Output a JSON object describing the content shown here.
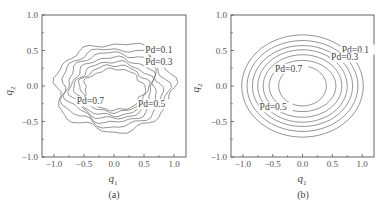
{
  "chart_data": [
    {
      "type": "contour",
      "panel_label": "(a)",
      "title": "",
      "xlabel": "q1",
      "ylabel": "q2",
      "xlim": [
        -1.2,
        1.2
      ],
      "ylim": [
        -1.0,
        1.0
      ],
      "xticks": [
        "-1.0",
        "-0.5",
        "0.0",
        "0.5",
        "1.0"
      ],
      "yticks": [
        "1.0",
        "0.5",
        "0.0",
        "-0.5",
        "-1.0"
      ],
      "grid": false,
      "style": "irregular empirical contours",
      "contour_levels": [
        0.1,
        0.2,
        0.3,
        0.4,
        0.5,
        0.6,
        0.7
      ],
      "contour_approx_extent": [
        {
          "level": 0.1,
          "rx": 0.98,
          "ry": 0.62,
          "cx": 0.0,
          "cy": -0.02
        },
        {
          "level": 0.2,
          "rx": 0.88,
          "ry": 0.55,
          "cx": 0.0,
          "cy": -0.02
        },
        {
          "level": 0.3,
          "rx": 0.79,
          "ry": 0.49,
          "cx": 0.0,
          "cy": -0.02
        },
        {
          "level": 0.4,
          "rx": 0.71,
          "ry": 0.43,
          "cx": 0.0,
          "cy": -0.03
        },
        {
          "level": 0.5,
          "rx": 0.64,
          "ry": 0.38,
          "cx": 0.0,
          "cy": -0.04
        },
        {
          "level": 0.6,
          "rx": 0.57,
          "ry": 0.33,
          "cx": 0.0,
          "cy": -0.04
        },
        {
          "level": 0.7,
          "rx": 0.5,
          "ry": 0.29,
          "cx": 0.0,
          "cy": -0.05
        }
      ],
      "annotations": [
        {
          "text": "Pd=0.1",
          "x": 0.52,
          "y": 0.47
        },
        {
          "text": "Pd=0.3",
          "x": 0.52,
          "y": 0.29
        },
        {
          "text": "Pd=0.7",
          "x": -0.62,
          "y": -0.26
        },
        {
          "text": "Pd=0.5",
          "x": 0.4,
          "y": -0.3
        }
      ]
    },
    {
      "type": "contour",
      "panel_label": "(b)",
      "title": "",
      "xlabel": "q1",
      "ylabel": "q2",
      "xlim": [
        -1.2,
        1.2
      ],
      "ylim": [
        -1.0,
        1.0
      ],
      "xticks": [
        "-1.0",
        "-0.5",
        "0.0",
        "0.5",
        "1.0"
      ],
      "yticks": [
        "1.0",
        "0.5",
        "0.0",
        "-0.5",
        "-1.0"
      ],
      "grid": false,
      "style": "smooth concentric ellipses",
      "contour_levels": [
        0.1,
        0.2,
        0.3,
        0.4,
        0.5,
        0.6,
        0.7
      ],
      "contour_approx_extent": [
        {
          "level": 0.1,
          "rx": 1.02,
          "ry": 0.72,
          "cx": 0.0,
          "cy": 0.0
        },
        {
          "level": 0.2,
          "rx": 0.93,
          "ry": 0.64,
          "cx": 0.0,
          "cy": 0.0
        },
        {
          "level": 0.3,
          "rx": 0.84,
          "ry": 0.57,
          "cx": 0.0,
          "cy": 0.0
        },
        {
          "level": 0.4,
          "rx": 0.75,
          "ry": 0.51,
          "cx": 0.0,
          "cy": 0.0
        },
        {
          "level": 0.5,
          "rx": 0.66,
          "ry": 0.44,
          "cx": 0.0,
          "cy": 0.0
        },
        {
          "level": 0.6,
          "rx": 0.56,
          "ry": 0.36,
          "cx": 0.0,
          "cy": 0.0
        },
        {
          "level": 0.7,
          "rx": 0.4,
          "ry": 0.28,
          "cx": 0.0,
          "cy": 0.0
        }
      ],
      "annotations": [
        {
          "text": "Pd=0.1",
          "x": 0.66,
          "y": 0.47
        },
        {
          "text": "Pd=0.3",
          "x": 0.48,
          "y": 0.36
        },
        {
          "text": "Pd=0.7",
          "x": -0.46,
          "y": 0.2
        },
        {
          "text": "Pd=0.5",
          "x": -0.72,
          "y": -0.34
        }
      ]
    }
  ],
  "panels": [
    {
      "label": "(a)",
      "xlabel_main": "q",
      "xlabel_sub": "1",
      "ylabel_main": "q",
      "ylabel_sub": "2"
    },
    {
      "label": "(b)",
      "xlabel_main": "q",
      "xlabel_sub": "1",
      "ylabel_main": "q",
      "ylabel_sub": "2"
    }
  ]
}
